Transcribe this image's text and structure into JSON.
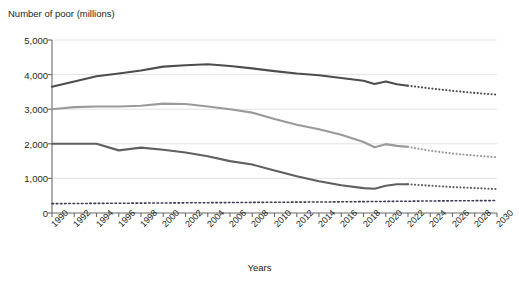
{
  "chart_data": {
    "type": "line",
    "title": "",
    "ylabel": "Number of poor (millions)",
    "xlabel": "Years",
    "ylim": [
      0,
      5000
    ],
    "xlim": [
      1990,
      2030
    ],
    "yticks": [
      0,
      1000,
      2000,
      3000,
      4000,
      5000
    ],
    "ytick_labels": [
      "0",
      "1,000",
      "2,000",
      "3,000",
      "4,000",
      "5,000"
    ],
    "xticks": [
      1990,
      1992,
      1994,
      1996,
      1998,
      2000,
      2002,
      2004,
      2006,
      2008,
      2010,
      2012,
      2014,
      2016,
      2018,
      2020,
      2022,
      2024,
      2026,
      2028,
      2030
    ],
    "xtick_labels": [
      "1990",
      "1992",
      "1994",
      "1996",
      "1998",
      "2000",
      "2002",
      "2004",
      "2006",
      "2008",
      "2010",
      "2012",
      "2014",
      "2016",
      "2018",
      "2020",
      "2022",
      "2024",
      "2026",
      "2028",
      "2030"
    ],
    "grid": true,
    "grid_axis": "y",
    "legend": "none",
    "projection_start_year": 2022,
    "series": [
      {
        "name": "upper-line",
        "color": "#4d4d4d",
        "style_observed": "solid",
        "style_projected": "dotted",
        "x": [
          1990,
          1992,
          1994,
          1996,
          1998,
          2000,
          2002,
          2004,
          2006,
          2008,
          2010,
          2012,
          2014,
          2016,
          2018,
          2019,
          2020,
          2021,
          2022,
          2024,
          2026,
          2028,
          2030
        ],
        "values": [
          3650,
          3800,
          3950,
          4030,
          4120,
          4230,
          4270,
          4300,
          4250,
          4180,
          4100,
          4030,
          3980,
          3900,
          3820,
          3730,
          3800,
          3720,
          3680,
          3600,
          3530,
          3470,
          3420
        ]
      },
      {
        "name": "middle-line",
        "color": "#9a9a9a",
        "style_observed": "solid",
        "style_projected": "dotted",
        "x": [
          1990,
          1992,
          1994,
          1996,
          1998,
          2000,
          2002,
          2004,
          2006,
          2008,
          2010,
          2012,
          2014,
          2016,
          2018,
          2019,
          2020,
          2021,
          2022,
          2024,
          2026,
          2028,
          2030
        ],
        "values": [
          3000,
          3060,
          3080,
          3080,
          3100,
          3160,
          3150,
          3080,
          3000,
          2900,
          2720,
          2550,
          2420,
          2260,
          2050,
          1900,
          1990,
          1940,
          1910,
          1800,
          1720,
          1660,
          1610
        ]
      },
      {
        "name": "lower-line",
        "color": "#5f5f5f",
        "style_observed": "solid",
        "style_projected": "dotted",
        "x": [
          1990,
          1992,
          1994,
          1996,
          1998,
          2000,
          2002,
          2004,
          2006,
          2008,
          2010,
          2012,
          2014,
          2016,
          2018,
          2019,
          2020,
          2021,
          2022,
          2024,
          2026,
          2028,
          2030
        ],
        "values": [
          2000,
          2000,
          2000,
          1810,
          1890,
          1830,
          1750,
          1640,
          1500,
          1400,
          1230,
          1060,
          920,
          800,
          720,
          700,
          790,
          830,
          830,
          790,
          750,
          720,
          690
        ]
      },
      {
        "name": "baseline-dotted-line",
        "color": "#3d3d52",
        "style_observed": "dotted",
        "style_projected": "dotted",
        "x": [
          1990,
          1995,
          2000,
          2005,
          2010,
          2015,
          2020,
          2025,
          2030
        ],
        "values": [
          270,
          280,
          290,
          300,
          310,
          320,
          335,
          350,
          360
        ]
      }
    ]
  }
}
